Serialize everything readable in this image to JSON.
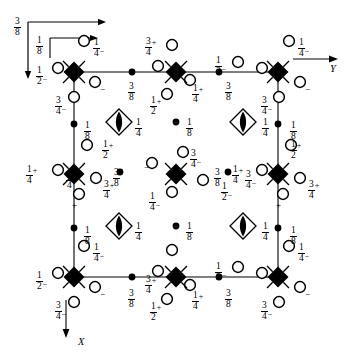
{
  "figure": {
    "domain": "crystallographic-space-group-diagram",
    "title": "",
    "axes": {
      "y_label": "Y",
      "x_label": "X",
      "origin_arrows": [
        {
          "name": "outer-origin-arrow",
          "label_num": "3",
          "label_den": "8"
        },
        {
          "name": "inner-origin-arrow",
          "label_num": "1",
          "label_den": "8"
        }
      ]
    },
    "cell": {
      "left": 74,
      "top": 72,
      "right": 278,
      "bottom": 277
    },
    "symbols": {
      "filled_diamond": "four-fold-rotoinversion-filled",
      "open_diamond_lens": "four-fold-inversion-axis",
      "filled_dot": "two-fold-axis-dot",
      "open_circle": "general-position-circle"
    },
    "annotations": {
      "quarter": {
        "n": "1",
        "d": "4"
      },
      "half": {
        "n": "1",
        "d": "2"
      },
      "three_quarter": {
        "n": "3",
        "d": "4"
      },
      "one_eighth": {
        "n": "1",
        "d": "8"
      },
      "three_eighth": {
        "n": "3",
        "d": "8"
      },
      "plus": "+",
      "minus": "−"
    },
    "text_items": [
      {
        "name": "origin-label-three-eighths",
        "x": 14,
        "y": 17,
        "type": "frac",
        "n": "3",
        "d": "8",
        "sign": ""
      },
      {
        "name": "origin-label-one-eighth",
        "x": 36,
        "y": 36,
        "type": "frac",
        "n": "1",
        "d": "8",
        "sign": ""
      },
      {
        "name": "axis-label-Y",
        "x": 330,
        "y": 63,
        "type": "axis",
        "text": "Y"
      },
      {
        "name": "axis-label-X",
        "x": 78,
        "y": 336,
        "type": "axis",
        "text": "X"
      },
      {
        "name": "lbl-tl-quarter-above",
        "x": 93,
        "y": 38,
        "type": "frac",
        "n": "1",
        "d": "4",
        "sign": "-"
      },
      {
        "name": "lbl-tl-half-left",
        "x": 36,
        "y": 66,
        "type": "frac",
        "n": "1",
        "d": "2",
        "sign": "-"
      },
      {
        "name": "lbl-tl-minus-right",
        "x": 100,
        "y": 80,
        "type": "sign",
        "text": "−"
      },
      {
        "name": "lbl-tl-threequarter-below",
        "x": 55,
        "y": 96,
        "type": "frac",
        "n": "3",
        "d": "4",
        "sign": "-"
      },
      {
        "name": "lbl-top-threeeighth-1",
        "x": 128,
        "y": 82,
        "type": "frac",
        "n": "3",
        "d": "8",
        "sign": ""
      },
      {
        "name": "lbl-top-threequarter-plus",
        "x": 145,
        "y": 37,
        "type": "frac",
        "n": "3",
        "d": "4",
        "sign": "+"
      },
      {
        "name": "lbl-top-half-plus",
        "x": 150,
        "y": 96,
        "type": "frac",
        "n": "1",
        "d": "2",
        "sign": "+"
      },
      {
        "name": "lbl-top-quarter-plus",
        "x": 192,
        "y": 84,
        "type": "frac",
        "n": "1",
        "d": "4",
        "sign": "+"
      },
      {
        "name": "lbl-top-threeeighth-2",
        "x": 225,
        "y": 82,
        "type": "frac",
        "n": "3",
        "d": "8",
        "sign": ""
      },
      {
        "name": "lbl-top-half-minus",
        "x": 215,
        "y": 56,
        "type": "frac",
        "n": "1",
        "d": "2",
        "sign": "-"
      },
      {
        "name": "lbl-tr-quarter-above",
        "x": 298,
        "y": 38,
        "type": "frac",
        "n": "1",
        "d": "4",
        "sign": "-"
      },
      {
        "name": "lbl-tr-minus-right",
        "x": 305,
        "y": 80,
        "type": "sign",
        "text": "−"
      },
      {
        "name": "lbl-tr-threequarter-below",
        "x": 261,
        "y": 96,
        "type": "frac",
        "n": "3",
        "d": "4",
        "sign": "-"
      },
      {
        "name": "lbl-left-oneeighth-upper",
        "x": 84,
        "y": 121,
        "type": "frac",
        "n": "1",
        "d": "8",
        "sign": ""
      },
      {
        "name": "lbl-left-half-plus",
        "x": 102,
        "y": 140,
        "type": "frac",
        "n": "1",
        "d": "2",
        "sign": "+"
      },
      {
        "name": "lbl-left-quarter-plus",
        "x": 26,
        "y": 165,
        "type": "frac",
        "n": "1",
        "d": "4",
        "sign": "+"
      },
      {
        "name": "lbl-left-threequarter-plus",
        "x": 103,
        "y": 180,
        "type": "frac",
        "n": "3",
        "d": "4",
        "sign": "+"
      },
      {
        "name": "lbl-left-plus-below",
        "x": 72,
        "y": 196,
        "type": "sign",
        "text": "+"
      },
      {
        "name": "lbl-left-oneeighth-lower",
        "x": 84,
        "y": 226,
        "type": "frac",
        "n": "1",
        "d": "8",
        "sign": ""
      },
      {
        "name": "lbl-right-oneeighth-upper",
        "x": 290,
        "y": 121,
        "type": "frac",
        "n": "1",
        "d": "8",
        "sign": ""
      },
      {
        "name": "lbl-right-half-plus",
        "x": 290,
        "y": 140,
        "type": "frac",
        "n": "1",
        "d": "2",
        "sign": "+"
      },
      {
        "name": "lbl-right-quarter-plus",
        "x": 232,
        "y": 165,
        "type": "frac",
        "n": "1",
        "d": "4",
        "sign": "+"
      },
      {
        "name": "lbl-right-threequarter-plus",
        "x": 308,
        "y": 180,
        "type": "frac",
        "n": "3",
        "d": "4",
        "sign": "+"
      },
      {
        "name": "lbl-right-plus-below",
        "x": 276,
        "y": 196,
        "type": "sign",
        "text": "+"
      },
      {
        "name": "lbl-right-oneeighth-lower",
        "x": 290,
        "y": 226,
        "type": "frac",
        "n": "1",
        "d": "8",
        "sign": ""
      },
      {
        "name": "lbl-lens-tl-quarter",
        "x": 135,
        "y": 118,
        "type": "frac",
        "n": "1",
        "d": "4",
        "sign": ""
      },
      {
        "name": "lbl-lens-tr-quarter",
        "x": 262,
        "y": 118,
        "type": "frac",
        "n": "1",
        "d": "4",
        "sign": ""
      },
      {
        "name": "lbl-lens-bl-quarter",
        "x": 135,
        "y": 222,
        "type": "frac",
        "n": "1",
        "d": "4",
        "sign": ""
      },
      {
        "name": "lbl-lens-br-quarter",
        "x": 262,
        "y": 222,
        "type": "frac",
        "n": "1",
        "d": "4",
        "sign": ""
      },
      {
        "name": "lbl-dot-tl-oneeighth",
        "x": 186,
        "y": 118,
        "type": "frac",
        "n": "1",
        "d": "8",
        "sign": ""
      },
      {
        "name": "lbl-dot-bl-oneeighth",
        "x": 186,
        "y": 222,
        "type": "frac",
        "n": "1",
        "d": "8",
        "sign": ""
      },
      {
        "name": "lbl-center-threequarter-above",
        "x": 190,
        "y": 149,
        "type": "frac",
        "n": "3",
        "d": "4",
        "sign": "-"
      },
      {
        "name": "lbl-center-minus-left",
        "x": 144,
        "y": 158,
        "type": "sign",
        "text": "−"
      },
      {
        "name": "lbl-center-threeeighth-left",
        "x": 113,
        "y": 168,
        "type": "frac",
        "n": "3",
        "d": "8",
        "sign": ""
      },
      {
        "name": "lbl-center-threequarter-plus-far-left",
        "x": 66,
        "y": 170,
        "type": "frac",
        "n": "3",
        "d": "4",
        "sign": "+"
      },
      {
        "name": "lbl-center-threeeighth-right",
        "x": 214,
        "y": 168,
        "type": "frac",
        "n": "3",
        "d": "8",
        "sign": ""
      },
      {
        "name": "lbl-center-threequarter-minus-far-right",
        "x": 245,
        "y": 170,
        "type": "frac",
        "n": "3",
        "d": "4",
        "sign": "-"
      },
      {
        "name": "lbl-center-half-minus",
        "x": 221,
        "y": 182,
        "type": "frac",
        "n": "1",
        "d": "2",
        "sign": "-"
      },
      {
        "name": "lbl-center-quarter-below",
        "x": 149,
        "y": 192,
        "type": "frac",
        "n": "1",
        "d": "4",
        "sign": "-"
      },
      {
        "name": "lbl-bot-threequarter-plus",
        "x": 145,
        "y": 275,
        "type": "frac",
        "n": "3",
        "d": "4",
        "sign": "+"
      },
      {
        "name": "lbl-bot-threeeighth-1",
        "x": 128,
        "y": 289,
        "type": "frac",
        "n": "3",
        "d": "8",
        "sign": ""
      },
      {
        "name": "lbl-bot-half-plus",
        "x": 150,
        "y": 302,
        "type": "frac",
        "n": "1",
        "d": "2",
        "sign": "+"
      },
      {
        "name": "lbl-bot-quarter-plus",
        "x": 192,
        "y": 291,
        "type": "frac",
        "n": "1",
        "d": "4",
        "sign": "+"
      },
      {
        "name": "lbl-bot-threeeighth-2",
        "x": 225,
        "y": 289,
        "type": "frac",
        "n": "3",
        "d": "8",
        "sign": ""
      },
      {
        "name": "lbl-bot-half-minus",
        "x": 215,
        "y": 262,
        "type": "frac",
        "n": "1",
        "d": "2",
        "sign": "-"
      },
      {
        "name": "lbl-bl-quarter-above",
        "x": 93,
        "y": 243,
        "type": "frac",
        "n": "1",
        "d": "4",
        "sign": "-"
      },
      {
        "name": "lbl-bl-half-left",
        "x": 36,
        "y": 271,
        "type": "frac",
        "n": "1",
        "d": "2",
        "sign": "-"
      },
      {
        "name": "lbl-bl-minus-right",
        "x": 100,
        "y": 285,
        "type": "sign",
        "text": "−"
      },
      {
        "name": "lbl-bl-threequarter-below",
        "x": 55,
        "y": 301,
        "type": "frac",
        "n": "3",
        "d": "4",
        "sign": "-"
      },
      {
        "name": "lbl-br-quarter-above",
        "x": 298,
        "y": 243,
        "type": "frac",
        "n": "1",
        "d": "4",
        "sign": "-"
      },
      {
        "name": "lbl-br-minus-right",
        "x": 305,
        "y": 285,
        "type": "sign",
        "text": "−"
      },
      {
        "name": "lbl-br-threequarter-below",
        "x": 261,
        "y": 301,
        "type": "frac",
        "n": "3",
        "d": "4",
        "sign": "-"
      }
    ],
    "circles": [
      {
        "name": "circle-tl-above",
        "x": 84,
        "y": 41
      },
      {
        "name": "circle-tl-left",
        "x": 58,
        "y": 68
      },
      {
        "name": "circle-tl-right",
        "x": 95,
        "y": 82
      },
      {
        "name": "circle-tl-below",
        "x": 74,
        "y": 97
      },
      {
        "name": "circle-top-left-of-mid",
        "x": 158,
        "y": 66
      },
      {
        "name": "circle-top-above-mid",
        "x": 172,
        "y": 45
      },
      {
        "name": "circle-top-right-mid",
        "x": 190,
        "y": 80
      },
      {
        "name": "circle-top-below-mid",
        "x": 167,
        "y": 94
      },
      {
        "name": "circle-top-half-minus",
        "x": 238,
        "y": 62
      },
      {
        "name": "circle-tr-above",
        "x": 289,
        "y": 41
      },
      {
        "name": "circle-tr-left",
        "x": 262,
        "y": 68
      },
      {
        "name": "circle-tr-right",
        "x": 300,
        "y": 82
      },
      {
        "name": "circle-tr-below",
        "x": 279,
        "y": 97
      },
      {
        "name": "circle-left-above-mid",
        "x": 87,
        "y": 145
      },
      {
        "name": "circle-left-of-mid",
        "x": 58,
        "y": 170
      },
      {
        "name": "circle-left-right-mid",
        "x": 96,
        "y": 178
      },
      {
        "name": "circle-left-below-mid",
        "x": 79,
        "y": 194
      },
      {
        "name": "circle-right-above-mid",
        "x": 291,
        "y": 145
      },
      {
        "name": "circle-right-of-mid",
        "x": 262,
        "y": 170
      },
      {
        "name": "circle-right-right-mid",
        "x": 300,
        "y": 178
      },
      {
        "name": "circle-right-below-mid",
        "x": 283,
        "y": 194
      },
      {
        "name": "circle-center-above",
        "x": 183,
        "y": 152
      },
      {
        "name": "circle-center-left",
        "x": 152,
        "y": 163
      },
      {
        "name": "circle-center-right",
        "x": 203,
        "y": 180
      },
      {
        "name": "circle-center-below",
        "x": 172,
        "y": 192
      },
      {
        "name": "circle-bl-above",
        "x": 84,
        "y": 246
      },
      {
        "name": "circle-bl-left",
        "x": 58,
        "y": 273
      },
      {
        "name": "circle-bl-right",
        "x": 95,
        "y": 287
      },
      {
        "name": "circle-bl-below",
        "x": 74,
        "y": 302
      },
      {
        "name": "circle-bot-left-of-mid",
        "x": 158,
        "y": 271
      },
      {
        "name": "circle-bot-above-mid",
        "x": 172,
        "y": 250
      },
      {
        "name": "circle-bot-right-mid",
        "x": 190,
        "y": 285
      },
      {
        "name": "circle-bot-below-mid",
        "x": 167,
        "y": 299
      },
      {
        "name": "circle-bot-half-minus",
        "x": 238,
        "y": 267
      },
      {
        "name": "circle-br-above",
        "x": 289,
        "y": 246
      },
      {
        "name": "circle-br-left",
        "x": 262,
        "y": 273
      },
      {
        "name": "circle-br-right",
        "x": 300,
        "y": 287
      },
      {
        "name": "circle-br-below",
        "x": 279,
        "y": 302
      }
    ],
    "filled_dots": [
      {
        "name": "dot-top-edge-left",
        "x": 132,
        "y": 72
      },
      {
        "name": "dot-top-edge-right",
        "x": 219,
        "y": 72
      },
      {
        "name": "dot-left-edge-upper",
        "x": 74,
        "y": 124
      },
      {
        "name": "dot-left-edge-lower",
        "x": 74,
        "y": 228
      },
      {
        "name": "dot-right-edge-upper",
        "x": 278,
        "y": 124
      },
      {
        "name": "dot-right-edge-lower",
        "x": 278,
        "y": 228
      },
      {
        "name": "dot-bottom-edge-left",
        "x": 132,
        "y": 277
      },
      {
        "name": "dot-bottom-edge-right",
        "x": 219,
        "y": 277
      },
      {
        "name": "dot-interior-tl",
        "x": 176,
        "y": 122
      },
      {
        "name": "dot-interior-bl",
        "x": 176,
        "y": 226
      },
      {
        "name": "dot-interior-midleft",
        "x": 120,
        "y": 172
      },
      {
        "name": "dot-interior-midright",
        "x": 228,
        "y": 172
      }
    ],
    "filled_diamonds": [
      {
        "name": "diamond-corner-tl",
        "x": 74,
        "y": 72
      },
      {
        "name": "diamond-corner-tr",
        "x": 278,
        "y": 72
      },
      {
        "name": "diamond-corner-bl",
        "x": 74,
        "y": 277
      },
      {
        "name": "diamond-corner-br",
        "x": 278,
        "y": 277
      },
      {
        "name": "diamond-edge-top",
        "x": 176,
        "y": 72
      },
      {
        "name": "diamond-edge-bottom",
        "x": 176,
        "y": 277
      },
      {
        "name": "diamond-edge-left",
        "x": 74,
        "y": 174
      },
      {
        "name": "diamond-edge-right",
        "x": 278,
        "y": 174
      },
      {
        "name": "diamond-center",
        "x": 176,
        "y": 174
      }
    ],
    "lens_diamonds": [
      {
        "name": "lens-diamond-tl",
        "x": 119,
        "y": 122
      },
      {
        "name": "lens-diamond-tr",
        "x": 243,
        "y": 122
      },
      {
        "name": "lens-diamond-bl",
        "x": 119,
        "y": 226
      },
      {
        "name": "lens-diamond-br",
        "x": 243,
        "y": 226
      }
    ]
  }
}
